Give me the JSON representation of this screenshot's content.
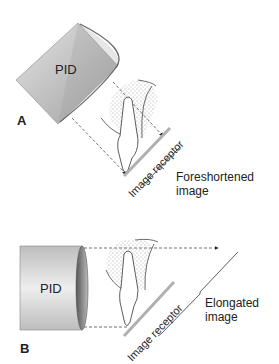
{
  "panel_a": {
    "letter": "A",
    "pid_label": "PID",
    "receptor_label": "Image receptor",
    "result_line1": "Foreshortened",
    "result_line2": "image"
  },
  "panel_b": {
    "letter": "B",
    "pid_label": "PID",
    "receptor_label": "Image receptor",
    "result_line1": "Elongated",
    "result_line2": "image"
  },
  "colors": {
    "pid_fill": "#c8c8c8",
    "ink": "#222222",
    "receptor": "#b0b0b0",
    "bone_dots": "#9a9a9a"
  }
}
